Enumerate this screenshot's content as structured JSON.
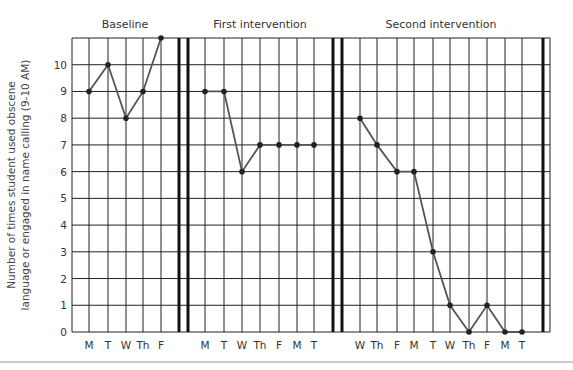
{
  "chart_data": {
    "type": "line",
    "title": "",
    "xlabel": "",
    "ylabel": "Number of times student used obscene language or engaged in name calling (9-10 AM)",
    "ylabel_lines": [
      "Number of times student used obscene",
      "language or engaged in name calling (9-10 AM)"
    ],
    "ylim": [
      0,
      11
    ],
    "yticks": [
      0,
      1,
      2,
      3,
      4,
      5,
      6,
      7,
      8,
      9,
      10
    ],
    "grid": true,
    "phases": [
      {
        "name": "Baseline",
        "categories": [
          "M",
          "T",
          "W",
          "Th",
          "F"
        ],
        "values": [
          9,
          10,
          8,
          9,
          11
        ]
      },
      {
        "name": "First intervention",
        "categories": [
          "M",
          "T",
          "W",
          "Th",
          "F",
          "M",
          "T"
        ],
        "values": [
          9,
          9,
          6,
          7,
          7,
          7,
          7
        ]
      },
      {
        "name": "Second intervention",
        "categories": [
          "W",
          "Th",
          "F",
          "M",
          "T",
          "W",
          "Th",
          "F",
          "M",
          "T"
        ],
        "values": [
          8,
          7,
          6,
          6,
          3,
          1,
          0,
          1,
          0,
          0
        ]
      }
    ],
    "legend": "none"
  },
  "layout": {
    "plot_left": 72,
    "plot_right": 550,
    "plot_top": 38,
    "plot_bottom": 332,
    "phase_x": [
      [
        89,
        108,
        126,
        143,
        161
      ],
      [
        205,
        224,
        242,
        260,
        279,
        297,
        314
      ],
      [
        360,
        377,
        397,
        414,
        433,
        450,
        469,
        487,
        505,
        522
      ]
    ],
    "extra_grid_x": [],
    "phase_dividers": [
      [
        179,
        188
      ],
      [
        333,
        342
      ],
      [
        543
      ]
    ],
    "title_x": [
      125,
      260,
      441
    ],
    "colors": {
      "grid": "#222222",
      "series": "#555555",
      "point": "#222222"
    }
  }
}
